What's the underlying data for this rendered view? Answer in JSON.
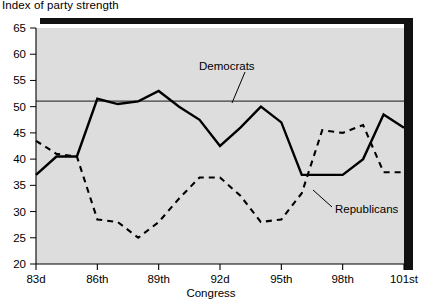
{
  "chart_data": {
    "type": "line",
    "title": "Index of party strength",
    "xlabel": "Congress",
    "ylabel": "",
    "ylim": [
      20,
      65
    ],
    "yticks": [
      20,
      25,
      30,
      35,
      40,
      45,
      50,
      55,
      60,
      65
    ],
    "xticks": [
      "83d",
      "86th",
      "89th",
      "92d",
      "95th",
      "98th",
      "101st"
    ],
    "x": [
      "83d",
      "84th",
      "85th",
      "86th",
      "87th",
      "88th",
      "89th",
      "90th",
      "91st",
      "92d",
      "93d",
      "94th",
      "95th",
      "96th",
      "97th",
      "98th",
      "99th",
      "100th",
      "101st"
    ],
    "grid": false,
    "reference_line": 50,
    "legend_position": "inline-annotation",
    "series": [
      {
        "name": "Democrats",
        "style": "solid",
        "color": "#000000",
        "values": [
          37,
          40.5,
          40.5,
          51.5,
          50.5,
          51,
          53,
          50,
          47.5,
          42.5,
          46,
          50,
          47,
          37,
          37,
          37,
          40,
          48.5,
          46
        ]
      },
      {
        "name": "Republicans",
        "style": "dashed",
        "color": "#000000",
        "values": [
          43.5,
          41,
          40.5,
          28.5,
          28,
          25,
          28,
          32.5,
          36.5,
          36.5,
          33,
          28,
          28.5,
          33.5,
          45.5,
          45,
          46.5,
          37.5,
          37.5
        ]
      }
    ],
    "annotations": [
      {
        "text": "Democrats",
        "x_label": "89th",
        "value": 57.5
      },
      {
        "text": "Republicans",
        "x_label": "97th",
        "value": 28.5
      }
    ]
  }
}
